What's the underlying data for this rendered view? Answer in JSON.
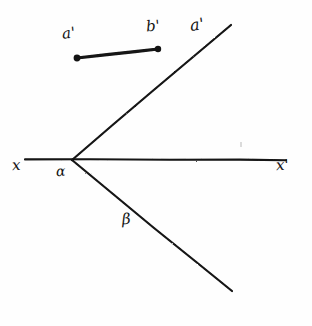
{
  "figure": {
    "kind": "hand-drawn-geometry-diagram",
    "ink_color": "#131313",
    "paper_color": "#fefefe",
    "width": 312,
    "height": 326
  },
  "labels": {
    "segment_left": "a'",
    "segment_right": "b'",
    "upper_ray": "a'",
    "axis_left": "x",
    "axis_right": "x'",
    "vertex_angle": "α",
    "lower_ray": "β"
  },
  "geometry": {
    "vertex": {
      "x": 72,
      "y": 160
    },
    "axis": {
      "x1": 25,
      "y1": 159,
      "x2": 286,
      "y2": 160
    },
    "upper_ray": {
      "x1": 72,
      "y1": 160,
      "x2": 231,
      "y2": 25
    },
    "lower_ray": {
      "x1": 72,
      "y1": 160,
      "x2": 232,
      "y2": 291
    },
    "segment": {
      "x1": 77,
      "y1": 58,
      "x2": 158,
      "y2": 49,
      "dot_radius": 3.2
    }
  }
}
